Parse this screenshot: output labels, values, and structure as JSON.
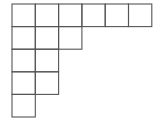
{
  "diagram": {
    "type": "young-diagram",
    "row_lengths": [
      6,
      3,
      2,
      2,
      1
    ],
    "origin": {
      "x": 12,
      "y": 4
    },
    "cell_width": 23.3,
    "cell_height": 22.6,
    "line_color": "#555555",
    "line_width": 1.1,
    "background": "#ffffff"
  }
}
